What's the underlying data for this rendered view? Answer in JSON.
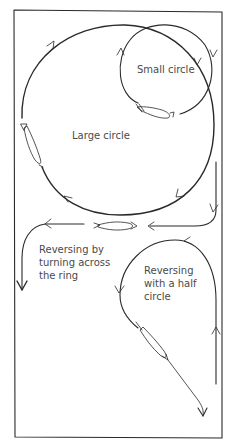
{
  "diagram": {
    "labels": {
      "small_circle": "Small circle",
      "large_circle": "Large circle",
      "reverse_across": [
        "Reversing by",
        "turning across",
        "the ring"
      ],
      "reverse_half": [
        "Reversing",
        "with a half",
        "circle"
      ]
    },
    "colors": {
      "line": "#2a2a2a",
      "text": "#4a4a4a",
      "background": "#ffffff"
    },
    "figures": [
      {
        "name": "large-circle",
        "arrows": 4
      },
      {
        "name": "small-circle",
        "arrows": 2
      },
      {
        "name": "reverse-across-ring",
        "arrows": 3
      },
      {
        "name": "reverse-half-circle",
        "arrows": 4
      }
    ]
  }
}
